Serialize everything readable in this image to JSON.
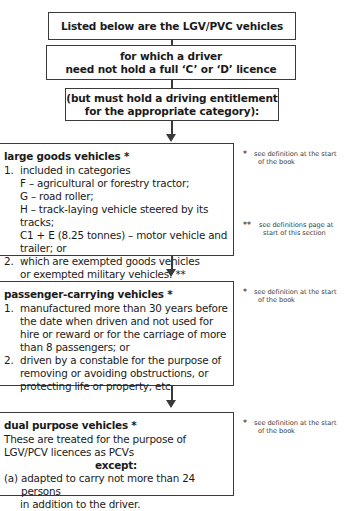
{
  "diagram": {
    "nodes": {
      "intro": {
        "line1": "Listed below are the LGV/PVC vehicles"
      },
      "driver": {
        "line1": "for which a driver",
        "line2": "need not hold a full ‘C’ or ‘D’ licence"
      },
      "entitlement": {
        "line1": "(but must hold a driving entitlement",
        "line2": "for the appropriate category):"
      },
      "lgv": {
        "heading": "large goods vehicles *",
        "item1_num": "1.",
        "item1_text": "included in categories",
        "cat_f": "F – agricultural or forestry tractor;",
        "cat_g": "G – road roller;",
        "cat_h": "H – track-laying vehicle steered by its tracks;",
        "cat_c1e_l1": "C1 + E (8.25 tonnes) – motor vehicle and",
        "cat_c1e_l2": "trailer; or",
        "item2_num": "2.",
        "item2_l1": "which are exempted goods vehicles",
        "item2_l2": "or exempted military vehicles: **"
      },
      "pcv": {
        "heading": "passenger-carrying vehicles *",
        "item1_num": "1.",
        "item1_l1": "manufactured more than 30 years before",
        "item1_l2": "the date when driven and not used for",
        "item1_l3": "hire or reward or for the carriage of more",
        "item1_l4": "than 8 passengers; or",
        "item2_num": "2.",
        "item2_l1": "driven by a constable for the purpose of",
        "item2_l2": "removing or avoiding obstructions, or",
        "item2_l3": "protecting life or property, etc."
      },
      "dual": {
        "heading": "dual purpose vehicles *",
        "line1": "These are treated for the purpose of",
        "line2": "LGV/PCV licences as PCVs",
        "except": "except:",
        "item_a_num": "(a)",
        "item_a_l1": "adapted to carry not more than 24 persons",
        "item_a_l2": "in addition to the driver."
      }
    },
    "notes": {
      "lgv_single": {
        "marker": "*",
        "line1": "see definition at the start",
        "line2": "of the book"
      },
      "lgv_double": {
        "marker": "**",
        "line1": "see definitions page at",
        "line2": "start of this section"
      },
      "pcv_single": {
        "marker": "*",
        "line1": "see definition at the start",
        "line2": "of the book"
      },
      "dual_single": {
        "marker": "*",
        "line1": "see definition at the start",
        "line2": "of the book"
      }
    },
    "colors": {
      "border": "#3a3a3a",
      "text": "#1a1a1a",
      "note_text": "#3d3d3d",
      "background": "#ffffff"
    }
  }
}
